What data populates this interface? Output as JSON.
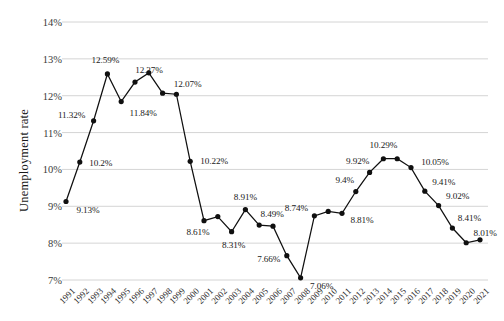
{
  "chart_data": {
    "type": "line",
    "title": "",
    "xlabel": "",
    "ylabel": "Unemployment rate",
    "ylim": [
      7,
      14
    ],
    "ytick_labels": [
      "14%",
      "13%",
      "12%",
      "11%",
      "10%",
      "9%",
      "8%",
      "7%"
    ],
    "ytick_values": [
      14,
      13,
      12,
      11,
      10,
      9,
      8,
      7
    ],
    "grid": true,
    "legend": "none",
    "marker": "filled-circle",
    "line_color": "#101010",
    "grid_color": "#c9c9c9",
    "categories": [
      "1991",
      "1992",
      "1993",
      "1994",
      "1995",
      "1996",
      "1997",
      "1998",
      "1999",
      "2000",
      "2001",
      "2002",
      "2003",
      "2004",
      "2005",
      "2006",
      "2007",
      "2008",
      "2009",
      "2010",
      "2011",
      "2012",
      "2013",
      "2014",
      "2015",
      "2016",
      "2017",
      "2018",
      "2019",
      "2020",
      "2021"
    ],
    "values": [
      9.13,
      10.2,
      11.32,
      12.59,
      11.84,
      12.37,
      12.62,
      12.07,
      12.04,
      10.22,
      8.61,
      8.72,
      8.31,
      8.91,
      8.49,
      8.46,
      7.66,
      7.06,
      8.74,
      8.86,
      8.81,
      9.4,
      9.92,
      10.29,
      10.29,
      10.05,
      9.41,
      9.02,
      8.41,
      8.01,
      8.09
    ],
    "point_labels": [
      {
        "category": "1991",
        "value": 9.13,
        "text": "9.13%",
        "shown": true
      },
      {
        "category": "1992",
        "value": 10.2,
        "text": "10.2%",
        "shown": true
      },
      {
        "category": "1993",
        "value": 11.32,
        "text": "11.32%",
        "shown": true
      },
      {
        "category": "1994",
        "value": 12.59,
        "text": "12.59%",
        "shown": true
      },
      {
        "category": "1995",
        "value": 11.84,
        "text": "11.84%",
        "shown": true
      },
      {
        "category": "1996",
        "value": 12.37,
        "text": "12.37%",
        "shown": true
      },
      {
        "category": "1997",
        "value": 12.62,
        "text": "",
        "shown": false
      },
      {
        "category": "1998",
        "value": 12.07,
        "text": "12.07%",
        "shown": true
      },
      {
        "category": "1999",
        "value": 12.04,
        "text": "",
        "shown": false
      },
      {
        "category": "2000",
        "value": 10.22,
        "text": "10.22%",
        "shown": true
      },
      {
        "category": "2001",
        "value": 8.61,
        "text": "8.61%",
        "shown": true
      },
      {
        "category": "2002",
        "value": 8.72,
        "text": "",
        "shown": false
      },
      {
        "category": "2003",
        "value": 8.31,
        "text": "8.31%",
        "shown": true
      },
      {
        "category": "2004",
        "value": 8.91,
        "text": "8.91%",
        "shown": true
      },
      {
        "category": "2005",
        "value": 8.49,
        "text": "8.49%",
        "shown": true
      },
      {
        "category": "2006",
        "value": 8.46,
        "text": "",
        "shown": false
      },
      {
        "category": "2007",
        "value": 7.66,
        "text": "7.66%",
        "shown": true
      },
      {
        "category": "2008",
        "value": 7.06,
        "text": "7.06%",
        "shown": true
      },
      {
        "category": "2009",
        "value": 8.74,
        "text": "8.74%",
        "shown": true
      },
      {
        "category": "2010",
        "value": 8.86,
        "text": "",
        "shown": false
      },
      {
        "category": "2011",
        "value": 8.81,
        "text": "8.81%",
        "shown": true
      },
      {
        "category": "2012",
        "value": 9.4,
        "text": "9.4%",
        "shown": true
      },
      {
        "category": "2013",
        "value": 9.92,
        "text": "9.92%",
        "shown": true
      },
      {
        "category": "2014",
        "value": 10.29,
        "text": "10.29%",
        "shown": true
      },
      {
        "category": "2015",
        "value": 10.29,
        "text": "",
        "shown": false
      },
      {
        "category": "2016",
        "value": 10.05,
        "text": "10.05%",
        "shown": true
      },
      {
        "category": "2017",
        "value": 9.41,
        "text": "9.41%",
        "shown": true
      },
      {
        "category": "2018",
        "value": 9.02,
        "text": "9.02%",
        "shown": true
      },
      {
        "category": "2019",
        "value": 8.41,
        "text": "8.41%",
        "shown": true
      },
      {
        "category": "2020",
        "value": 8.01,
        "text": "8.01%",
        "shown": true
      },
      {
        "category": "2021",
        "value": 8.09,
        "text": "",
        "shown": false
      }
    ],
    "label_offsets": [
      {
        "category": "1991",
        "dx": 22,
        "dy": 9
      },
      {
        "category": "1992",
        "dx": 21,
        "dy": 1
      },
      {
        "category": "1993",
        "dx": -22,
        "dy": -6
      },
      {
        "category": "1994",
        "dx": -2,
        "dy": -14
      },
      {
        "category": "1995",
        "dx": 22,
        "dy": 11
      },
      {
        "category": "1996",
        "dx": 14,
        "dy": -12
      },
      {
        "category": "1998",
        "dx": 25,
        "dy": -9
      },
      {
        "category": "2000",
        "dx": 24,
        "dy": 0
      },
      {
        "category": "2001",
        "dx": -6,
        "dy": 11
      },
      {
        "category": "2003",
        "dx": 2,
        "dy": 13
      },
      {
        "category": "2004",
        "dx": 0,
        "dy": -13
      },
      {
        "category": "2005",
        "dx": 13,
        "dy": -11
      },
      {
        "category": "2007",
        "dx": -18,
        "dy": 3
      },
      {
        "category": "2008",
        "dx": 21,
        "dy": 8
      },
      {
        "category": "2009",
        "dx": -18,
        "dy": -8
      },
      {
        "category": "2011",
        "dx": 20,
        "dy": 7
      },
      {
        "category": "2012",
        "dx": -11,
        "dy": -12
      },
      {
        "category": "2013",
        "dx": -12,
        "dy": -11
      },
      {
        "category": "2014",
        "dx": 0,
        "dy": -14
      },
      {
        "category": "2016",
        "dx": 24,
        "dy": -6
      },
      {
        "category": "2017",
        "dx": 19,
        "dy": -9
      },
      {
        "category": "2018",
        "dx": 19,
        "dy": -10
      },
      {
        "category": "2019",
        "dx": 17,
        "dy": -10
      },
      {
        "category": "2020",
        "dx": 19,
        "dy": -10
      }
    ]
  }
}
